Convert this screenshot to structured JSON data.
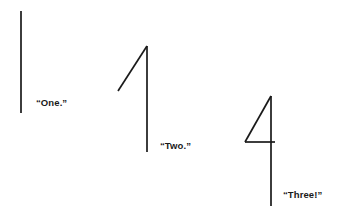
{
  "scene": {
    "title": "Counting Strokes",
    "background_color": "#ffffff",
    "ink_color": "#1a1a1a",
    "width": 348,
    "height": 213
  },
  "figures": [
    {
      "id": "figure-one",
      "caption": "“One.”",
      "description": "single vertical stroke",
      "strokes": [
        {
          "name": "vertical-stem",
          "x1": 21,
          "y1": 11,
          "x2": 21,
          "y2": 113
        }
      ]
    },
    {
      "id": "figure-two",
      "caption": "“Two.”",
      "description": "vertical stroke with diagonal flag forming a numeral one",
      "strokes": [
        {
          "name": "vertical-stem",
          "x1": 147,
          "y1": 46,
          "x2": 147,
          "y2": 152
        },
        {
          "name": "diagonal-flag",
          "x1": 147,
          "y1": 46,
          "x2": 118,
          "y2": 91
        }
      ]
    },
    {
      "id": "figure-three",
      "caption": "“Three!”",
      "description": "vertical stroke, diagonal and crossbar forming a numeral four",
      "strokes": [
        {
          "name": "vertical-stem",
          "x1": 271,
          "y1": 96,
          "x2": 271,
          "y2": 206
        },
        {
          "name": "diagonal-flag",
          "x1": 271,
          "y1": 96,
          "x2": 245,
          "y2": 142
        },
        {
          "name": "crossbar",
          "x1": 245,
          "y1": 142,
          "x2": 275,
          "y2": 142
        }
      ]
    }
  ]
}
